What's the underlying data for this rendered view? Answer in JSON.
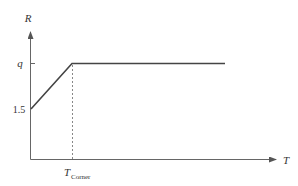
{
  "diagram": {
    "type": "piecewise-linear-plot",
    "y_axis": {
      "label": "R"
    },
    "x_axis": {
      "label": "T"
    },
    "y_ticks": [
      {
        "label": "q"
      },
      {
        "label": "1.5"
      }
    ],
    "x_ticks": [
      {
        "label_main": "T",
        "label_sub": "Corner"
      }
    ],
    "curve": {
      "description": "Linear rise from 1.5 at T=0 to q at T_Corner, then constant at q",
      "points": [
        {
          "T": "0",
          "R": "1.5"
        },
        {
          "T": "T_Corner",
          "R": "q"
        },
        {
          "T": "end",
          "R": "q"
        }
      ]
    },
    "guide_line": {
      "style": "dashed",
      "from": "T_Corner on x-axis",
      "to": "corner point"
    },
    "colors": {
      "curve": "#444444",
      "axes": "#666666",
      "dashed": "#888888",
      "text": "#333333"
    }
  }
}
